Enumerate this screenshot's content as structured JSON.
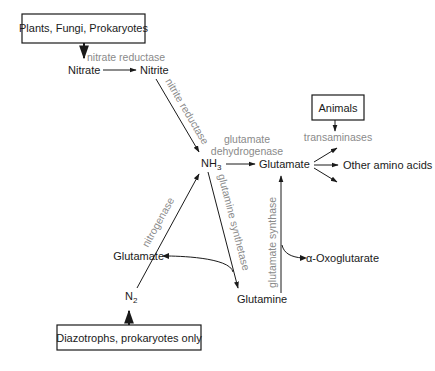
{
  "diagram": {
    "boxes": {
      "plants": "Plants, Fungi, Prokaryotes",
      "animals": "Animals",
      "diazotrophs": "Diazotrophs, prokaryotes only"
    },
    "nodes": {
      "nitrate": "Nitrate",
      "nitrite": "Nitrite",
      "nh3_main": "NH",
      "nh3_sub": "3",
      "glutamate_main": "Glutamate",
      "glutamate_side": "Glutamate",
      "glutamine": "Glutamine",
      "oxoglutarate": "α-Oxoglutarate",
      "other_amino_acids": "Other amino acids",
      "n2_main": "N",
      "n2_sub": "2"
    },
    "enzymes": {
      "nitrate_reductase": "nitrate reductase",
      "nitrite_reductase": "nitrite reductase",
      "glutamate_dehydrogenase_1": "glutamate",
      "glutamate_dehydrogenase_2": "dehydrogenase",
      "transaminases": "transaminases",
      "glutamine_synthetase": "glutamine synthetase",
      "glutamate_synthase": "glutamate synthase",
      "nitrogenase": "nitrogenase"
    },
    "colors": {
      "text": "#1a1a1a",
      "enzyme_text": "#8a8a8a",
      "background": "#ffffff"
    }
  }
}
